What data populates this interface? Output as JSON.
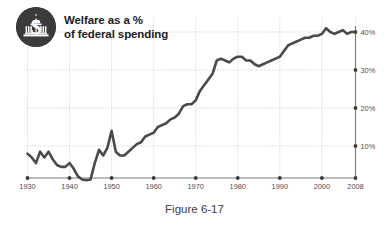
{
  "figure": {
    "caption": "Figure 6-17"
  },
  "header": {
    "title": "Welfare as a %\nof federal spending",
    "badge_icon": "dollar-capitol-icon"
  },
  "chart_data": {
    "type": "line",
    "title": "Welfare as a % of federal spending",
    "xlabel": "",
    "ylabel": "",
    "xlim": [
      1930,
      2008
    ],
    "ylim": [
      0,
      43
    ],
    "grid": true,
    "legend": false,
    "x_ticks": [
      "1930",
      "1940",
      "1950",
      "1960",
      "1970",
      "1980",
      "1990",
      "2000",
      "2008"
    ],
    "x_tick_values": [
      1930,
      1940,
      1950,
      1960,
      1970,
      1980,
      1990,
      2000,
      2008
    ],
    "y_ticks": [
      "10%",
      "20%",
      "30%",
      "40%"
    ],
    "y_tick_values": [
      10,
      20,
      30,
      40
    ],
    "y_tick_side": "right",
    "line_color": "#4a4a4a",
    "grid_color": "#b9b9b9",
    "x": [
      1930,
      1931,
      1932,
      1933,
      1934,
      1935,
      1936,
      1937,
      1938,
      1939,
      1940,
      1941,
      1942,
      1943,
      1944,
      1945,
      1946,
      1947,
      1948,
      1949,
      1950,
      1951,
      1952,
      1953,
      1954,
      1955,
      1956,
      1957,
      1958,
      1959,
      1960,
      1961,
      1962,
      1963,
      1964,
      1965,
      1966,
      1967,
      1968,
      1969,
      1970,
      1971,
      1972,
      1973,
      1974,
      1975,
      1976,
      1977,
      1978,
      1979,
      1980,
      1981,
      1982,
      1983,
      1984,
      1985,
      1986,
      1987,
      1988,
      1989,
      1990,
      1991,
      1992,
      1993,
      1994,
      1995,
      1996,
      1997,
      1998,
      1999,
      2000,
      2001,
      2002,
      2003,
      2004,
      2005,
      2006,
      2007,
      2008
    ],
    "y": [
      8.0,
      7.0,
      5.5,
      8.5,
      7.0,
      8.5,
      6.5,
      5.0,
      4.5,
      4.5,
      5.5,
      4.0,
      2.0,
      1.2,
      1.0,
      1.2,
      5.5,
      9.0,
      7.5,
      9.5,
      14.0,
      8.5,
      7.5,
      7.5,
      8.5,
      9.5,
      10.5,
      11.0,
      12.5,
      13.0,
      13.5,
      15.0,
      15.5,
      16.0,
      17.0,
      17.5,
      18.5,
      20.5,
      21.0,
      21.0,
      22.0,
      24.5,
      26.0,
      27.5,
      29.0,
      32.5,
      33.0,
      32.5,
      32.0,
      33.0,
      33.5,
      33.5,
      32.5,
      32.5,
      31.5,
      31.0,
      31.5,
      32.0,
      32.5,
      33.0,
      33.5,
      35.0,
      36.5,
      37.0,
      37.5,
      38.0,
      38.5,
      38.5,
      39.0,
      39.0,
      39.5,
      41.0,
      40.0,
      39.5,
      40.0,
      40.5,
      39.5,
      40.0,
      40.0
    ]
  }
}
